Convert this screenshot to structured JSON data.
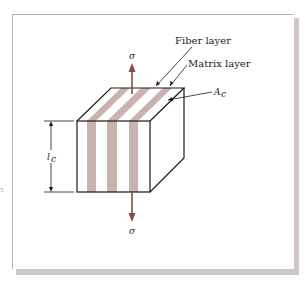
{
  "figure": {
    "labels": {
      "fiber_layer": "Fiber layer",
      "matrix_layer": "Matrix layer",
      "area": "A",
      "area_sub": "c",
      "length": "l",
      "length_sub": "c",
      "stress_top": "σ",
      "stress_bottom": "σ"
    },
    "margin_fragment": "5",
    "colors": {
      "fiber_stripe": "#c9b3b0",
      "arrow": "#8a4a3e",
      "outline": "#1a1a1a",
      "frame_shadow": "#cfc5c3"
    }
  }
}
